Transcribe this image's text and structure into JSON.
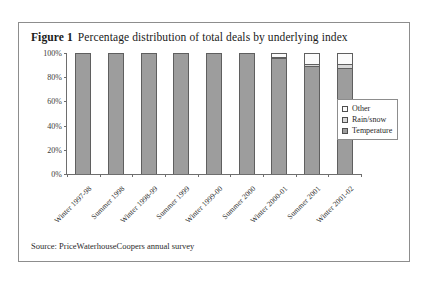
{
  "figure": {
    "label": "Figure 1",
    "title": "Percentage distribution of total deals by underlying index",
    "source": "Source: PriceWaterhouseCoopers annual survey"
  },
  "legend": {
    "items": [
      {
        "name": "other",
        "label": "Other",
        "color": "#fbfbfb"
      },
      {
        "name": "rainsnow",
        "label": "Rain/snow",
        "color": "#d8d8d8"
      },
      {
        "name": "temperature",
        "label": "Temperature",
        "color": "#9d9d9d"
      }
    ]
  },
  "axis": {
    "y_ticks": [
      "0%",
      "20%",
      "40%",
      "60%",
      "80%",
      "100%"
    ]
  },
  "chart_data": {
    "type": "bar",
    "subtype": "stacked-vertical-100-percent",
    "title": "Percentage distribution of total deals by underlying index",
    "xlabel": "",
    "ylabel": "",
    "ylim": [
      0,
      100
    ],
    "ytick_labels": [
      "0%",
      "20%",
      "40%",
      "60%",
      "80%",
      "100%"
    ],
    "ytick_values": [
      0,
      20,
      40,
      60,
      80,
      100
    ],
    "grid": false,
    "legend_position": "right-inside",
    "categories": [
      "Winter 1997-98",
      "Summer 1998",
      "Winter 1998-99",
      "Summer 1999",
      "Winter 1999-00",
      "Summer 2000",
      "Winter 2000-01",
      "Summer 2001",
      "Winter 2001-02"
    ],
    "series": [
      {
        "name": "Temperature",
        "color": "#9d9d9d",
        "values": [
          100,
          100,
          100,
          100,
          100,
          100,
          96,
          89,
          88
        ]
      },
      {
        "name": "Rain/snow",
        "color": "#d8d8d8",
        "values": [
          0,
          0,
          0,
          0,
          0,
          0,
          1,
          2,
          3
        ]
      },
      {
        "name": "Other",
        "color": "#fbfbfb",
        "values": [
          0,
          0,
          0,
          0,
          0,
          0,
          3,
          9,
          9
        ]
      }
    ]
  }
}
